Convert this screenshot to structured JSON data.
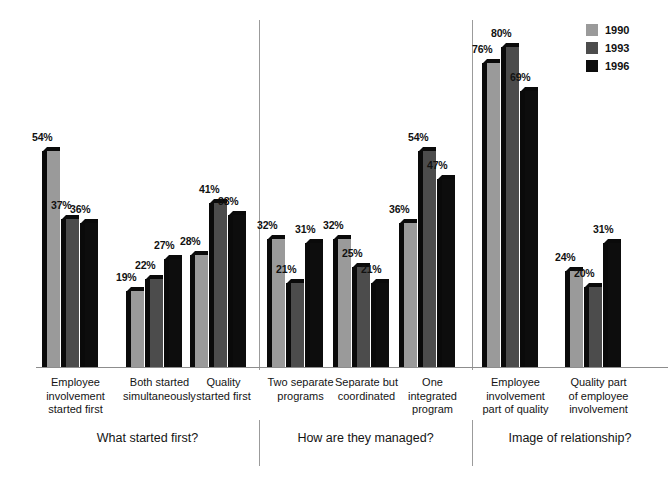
{
  "chart_data": {
    "type": "bar",
    "title": "",
    "subtitle": "",
    "xlabel": "",
    "ylabel": "",
    "ylim": [
      0,
      80
    ],
    "grid": false,
    "legend_position": "top-right",
    "value_suffix": "%",
    "series": [
      {
        "name": "1990",
        "color": "#9a9a9a",
        "values": [
          54,
          19,
          28,
          32,
          32,
          36,
          76,
          24
        ]
      },
      {
        "name": "1993",
        "color": "#4c4c4c",
        "values": [
          37,
          22,
          41,
          21,
          25,
          54,
          80,
          20
        ]
      },
      {
        "name": "1996",
        "color": "#0d0d0d",
        "values": [
          36,
          27,
          38,
          31,
          21,
          47,
          69,
          31
        ]
      }
    ],
    "categories": [
      "Employee\ninvolvement\nstarted first",
      "Both started\nsimultaneously",
      "Quality\nstarted first",
      "Two separate\nprograms",
      "Separate but\ncoordinated",
      "One\nintegrated\nprogram",
      "Employee\ninvolvement\npart of quality",
      "Quality part\nof employee\ninvolvement"
    ],
    "panels": [
      {
        "title": "What started first?",
        "category_indices": [
          0,
          1,
          2
        ]
      },
      {
        "title": "How are they managed?",
        "category_indices": [
          3,
          4,
          5
        ]
      },
      {
        "title": "Image of relationship?",
        "category_indices": [
          6,
          7
        ]
      }
    ]
  },
  "legend": {
    "items": [
      {
        "label": "1990",
        "color": "#9a9a9a"
      },
      {
        "label": "1993",
        "color": "#4c4c4c"
      },
      {
        "label": "1996",
        "color": "#0d0d0d"
      }
    ]
  },
  "axis": {
    "baseline_color": "#8d8d8d",
    "divider_color": "#9b9b9b"
  }
}
